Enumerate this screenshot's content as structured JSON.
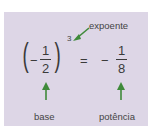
{
  "labels": {
    "exponent": "expoente",
    "base": "base",
    "power": "potência"
  },
  "expression": {
    "base_sign": "−",
    "base_num": "1",
    "base_den": "2",
    "exponent": "3",
    "equals": "=",
    "result_sign": "−",
    "result_num": "1",
    "result_den": "8"
  },
  "colors": {
    "background": "#ddd6e6",
    "arrow": "#3f8a3a",
    "text": "#3a3a3a"
  }
}
